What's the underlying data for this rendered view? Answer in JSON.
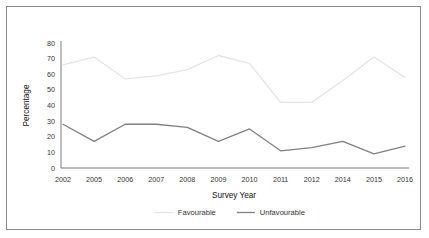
{
  "chart_data": {
    "type": "line",
    "title": "",
    "xlabel": "Survey Year",
    "ylabel": "Percentage",
    "categories": [
      "2002",
      "2005",
      "2006",
      "2007",
      "2008",
      "2009",
      "2010",
      "2011",
      "2012",
      "2014",
      "2015",
      "2016"
    ],
    "ylim": [
      0,
      80
    ],
    "yticks": [
      "0",
      "10",
      "20",
      "30",
      "40",
      "50",
      "60",
      "70",
      "80"
    ],
    "grid": false,
    "legend_position": "bottom",
    "series": [
      {
        "name": "Favourable",
        "color": "#e4e4e4",
        "values": [
          66,
          71,
          57,
          59,
          63,
          72,
          67,
          42,
          42,
          56,
          71,
          58
        ]
      },
      {
        "name": "Unfavourable",
        "color": "#808080",
        "values": [
          28,
          17,
          28,
          28,
          26,
          17,
          25,
          11,
          13,
          17,
          9,
          14
        ]
      }
    ]
  },
  "frame": {
    "border_color": "#8a8a8a",
    "background": "#ffffff"
  }
}
